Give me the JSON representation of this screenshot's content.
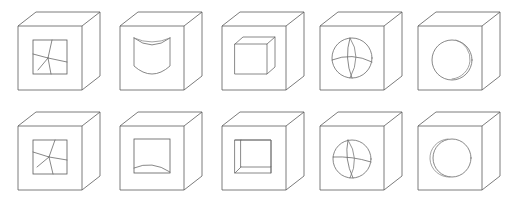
{
  "figure": {
    "background_color": "#ffffff",
    "line_color": "#5a5a5a",
    "detail_line_color": "#6a6a6a",
    "rows": 2,
    "columns": 5,
    "total_items": 10,
    "width_px": 519,
    "height_px": 205
  },
  "cells": [
    {
      "index": 1,
      "row": 1,
      "column": 1,
      "name": "cube-cracked-square-top",
      "face_inset": "square",
      "detail": "branching crack lines inside recessed square window",
      "x": 8,
      "y": 4
    },
    {
      "index": 2,
      "row": 1,
      "column": 2,
      "name": "cube-concave-cylinder-top",
      "face_inset": "rounded-cylinder",
      "detail": "protruding cylinder with concave top arc",
      "x": 110,
      "y": 4
    },
    {
      "index": 3,
      "row": 1,
      "column": 3,
      "name": "cube-inner-cube-top",
      "face_inset": "small-cube",
      "detail": "small cube protruding from front face",
      "x": 212,
      "y": 4
    },
    {
      "index": 4,
      "row": 1,
      "column": 4,
      "name": "cube-meridian-sphere-top",
      "face_inset": "sphere",
      "detail": "sphere with meridian and equator lines",
      "x": 310,
      "y": 4
    },
    {
      "index": 5,
      "row": 1,
      "column": 5,
      "name": "cube-plain-sphere-top",
      "face_inset": "sphere",
      "detail": "sphere with offset rim arc",
      "x": 408,
      "y": 4
    },
    {
      "index": 6,
      "row": 2,
      "column": 1,
      "name": "cube-cracked-square-bottom",
      "face_inset": "square",
      "detail": "branching crack lines inside recessed square window",
      "x": 8,
      "y": 104
    },
    {
      "index": 7,
      "row": 2,
      "column": 2,
      "name": "cube-concave-floor-bottom",
      "face_inset": "square",
      "detail": "square window with shallow concave arc at base",
      "x": 110,
      "y": 104
    },
    {
      "index": 8,
      "row": 2,
      "column": 3,
      "name": "cube-recessed-square-bottom",
      "face_inset": "square",
      "detail": "recessed square cavity with visible left and bottom inner walls",
      "x": 212,
      "y": 104
    },
    {
      "index": 9,
      "row": 2,
      "column": 4,
      "name": "cube-meridian-sphere-bottom",
      "face_inset": "sphere",
      "detail": "sphere with meridian and equator lines",
      "x": 310,
      "y": 104
    },
    {
      "index": 10,
      "row": 2,
      "column": 5,
      "name": "cube-plain-sphere-bottom",
      "face_inset": "sphere",
      "detail": "sphere with offset rim arc",
      "x": 408,
      "y": 104
    }
  ]
}
